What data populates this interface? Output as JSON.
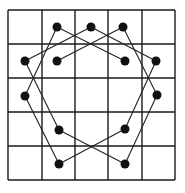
{
  "diagram": {
    "type": "grid-path-puzzle",
    "grid": {
      "columns": 5,
      "rows": 5,
      "x_lines": [
        8,
        42,
        75,
        108,
        142,
        175
      ],
      "y_lines": [
        10,
        44,
        78,
        112,
        146,
        180
      ],
      "line_color": "#1a1a1a"
    },
    "dots": [
      {
        "id": "d1",
        "x": 57,
        "y": 27
      },
      {
        "id": "d2",
        "x": 91,
        "y": 27
      },
      {
        "id": "d3",
        "x": 123,
        "y": 27
      },
      {
        "id": "d4",
        "x": 25,
        "y": 61
      },
      {
        "id": "d5",
        "x": 57,
        "y": 61
      },
      {
        "id": "d6",
        "x": 125,
        "y": 61
      },
      {
        "id": "d7",
        "x": 156,
        "y": 61
      },
      {
        "id": "d8",
        "x": 25,
        "y": 96
      },
      {
        "id": "d9",
        "x": 157,
        "y": 95
      },
      {
        "id": "d10",
        "x": 59,
        "y": 130
      },
      {
        "id": "d11",
        "x": 125,
        "y": 129
      },
      {
        "id": "d12",
        "x": 59,
        "y": 164
      },
      {
        "id": "d13",
        "x": 125,
        "y": 164
      }
    ],
    "edges": [
      [
        "d1",
        "d6"
      ],
      [
        "d1",
        "d8"
      ],
      [
        "d2",
        "d4"
      ],
      [
        "d2",
        "d7"
      ],
      [
        "d3",
        "d5"
      ],
      [
        "d3",
        "d9"
      ],
      [
        "d4",
        "d10"
      ],
      [
        "d8",
        "d12"
      ],
      [
        "d10",
        "d13"
      ],
      [
        "d12",
        "d11"
      ],
      [
        "d7",
        "d11"
      ],
      [
        "d9",
        "d13"
      ]
    ],
    "dot_radius": 4.5,
    "dot_color": "#111111",
    "edge_color": "#222222"
  }
}
